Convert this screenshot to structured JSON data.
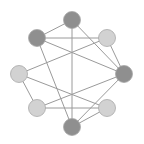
{
  "diagram": {
    "type": "network-graph",
    "colors": {
      "dark": "#8f8f8f",
      "light": "#d2d2d2",
      "edge": "#9a9a9a",
      "stroke": "#a8a8a8"
    },
    "nodes": [
      {
        "id": "top",
        "x": 72,
        "y": 20,
        "shade": "dark"
      },
      {
        "id": "upper-left",
        "x": 37,
        "y": 38,
        "shade": "dark"
      },
      {
        "id": "upper-right",
        "x": 107,
        "y": 38,
        "shade": "light"
      },
      {
        "id": "left",
        "x": 19,
        "y": 74,
        "shade": "light"
      },
      {
        "id": "right",
        "x": 124,
        "y": 74,
        "shade": "dark"
      },
      {
        "id": "lower-left",
        "x": 37,
        "y": 108,
        "shade": "light"
      },
      {
        "id": "lower-right",
        "x": 107,
        "y": 108,
        "shade": "light"
      },
      {
        "id": "bottom",
        "x": 72,
        "y": 127,
        "shade": "dark"
      }
    ],
    "edges": [
      [
        "top",
        "upper-left"
      ],
      [
        "top",
        "bottom"
      ],
      [
        "top",
        "right"
      ],
      [
        "upper-left",
        "upper-right"
      ],
      [
        "upper-left",
        "right"
      ],
      [
        "upper-left",
        "bottom"
      ],
      [
        "upper-right",
        "left"
      ],
      [
        "upper-right",
        "right"
      ],
      [
        "left",
        "lower-left"
      ],
      [
        "left",
        "lower-right"
      ],
      [
        "lower-left",
        "lower-right"
      ],
      [
        "lower-left",
        "right"
      ],
      [
        "right",
        "bottom"
      ],
      [
        "lower-right",
        "bottom"
      ]
    ]
  }
}
